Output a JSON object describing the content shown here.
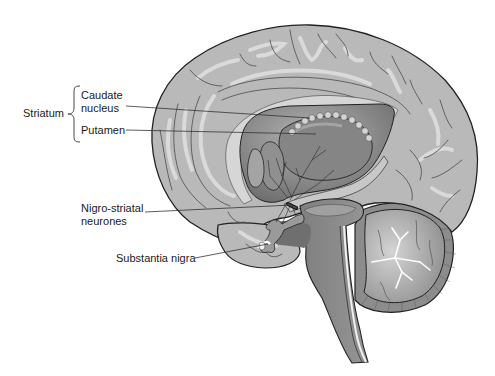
{
  "figure": {
    "colors": {
      "background": "#ffffff",
      "cortex_fill": "#b9b9b9",
      "cortex_highlight": "#dcdcdc",
      "sulcus_line": "#4a4a4a",
      "outline": "#222222",
      "striatum_fill": "#7d7d7d",
      "striatum_highlight": "#a8a8a8",
      "brainstem_fill": "#8c8c8c",
      "cerebellum_fill": "#9a9a9a",
      "cerebellum_rim": "#7a7a7a",
      "label_text": "#1a1a1a",
      "leader_line": "#333333"
    }
  },
  "labels": {
    "group": "Striatum",
    "caudate_line1": "Caudate",
    "caudate_line2": "nucleus",
    "putamen": "Putamen",
    "nigro_line1": "Nigro-striatal",
    "nigro_line2": "neurones",
    "substantia_nigra": "Substantia nigra"
  }
}
